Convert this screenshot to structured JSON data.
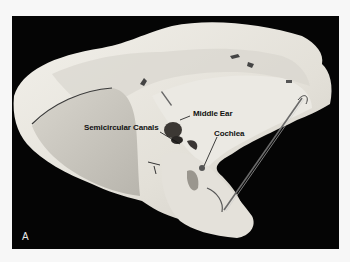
{
  "figure": {
    "panel_letter": "A",
    "labels": {
      "middle_ear": "Middle Ear",
      "semicircular_canals": "Semicircular Canals",
      "cochlea": "Cochlea"
    },
    "colors": {
      "background": "#050505",
      "bone": "#e9e6df",
      "shadow": "#bdbab2",
      "page": "#f7f7f7"
    }
  }
}
